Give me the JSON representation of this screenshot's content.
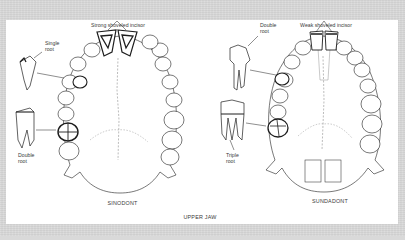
{
  "figure": {
    "bottom_title": "UPPER JAW",
    "panels": [
      {
        "id": "sinodont",
        "caption": "SINODONT",
        "incisor_label": "Strong shoveled incisor",
        "premolar_label": [
          "Single",
          "root"
        ],
        "molar_label": [
          "Double",
          "root"
        ]
      },
      {
        "id": "sundadont",
        "caption": "SUNDADONT",
        "incisor_label": "Weak shoveled incisor",
        "premolar_label": [
          "Double",
          "root"
        ],
        "molar_label": [
          "Triple",
          "root"
        ]
      }
    ]
  },
  "colors": {
    "background": "#d9d9d9",
    "panel": "#ffffff",
    "ink": "#1e1e1e",
    "label": "#3a3a3a"
  }
}
